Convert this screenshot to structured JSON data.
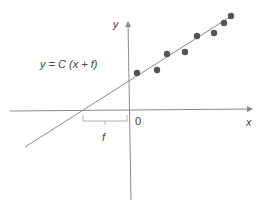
{
  "diagram": {
    "equation": "y = C (x + f)",
    "axis_labels": {
      "x": "x",
      "y": "y",
      "origin": "0"
    },
    "bracket_label": "f",
    "colors": {
      "axis": "#8a8a8a",
      "fit_line": "#8a8a8a",
      "points": "#555555",
      "bracket": "#b0b0b0",
      "text": "#444444"
    },
    "points_px": [
      [
        137,
        73
      ],
      [
        157,
        70
      ],
      [
        167,
        54
      ],
      [
        185,
        52
      ],
      [
        197,
        36
      ],
      [
        214,
        33
      ],
      [
        224,
        23
      ],
      [
        231,
        16
      ]
    ],
    "fit_line_px": {
      "x1": 25,
      "y1": 147,
      "x2": 233,
      "y2": 15
    },
    "x_axis_px": {
      "x1": 10,
      "y1": 111,
      "x2": 252,
      "y2": 109
    },
    "y_axis_px": {
      "x1": 131,
      "y1": 200,
      "x2": 128,
      "y2": 22
    }
  }
}
